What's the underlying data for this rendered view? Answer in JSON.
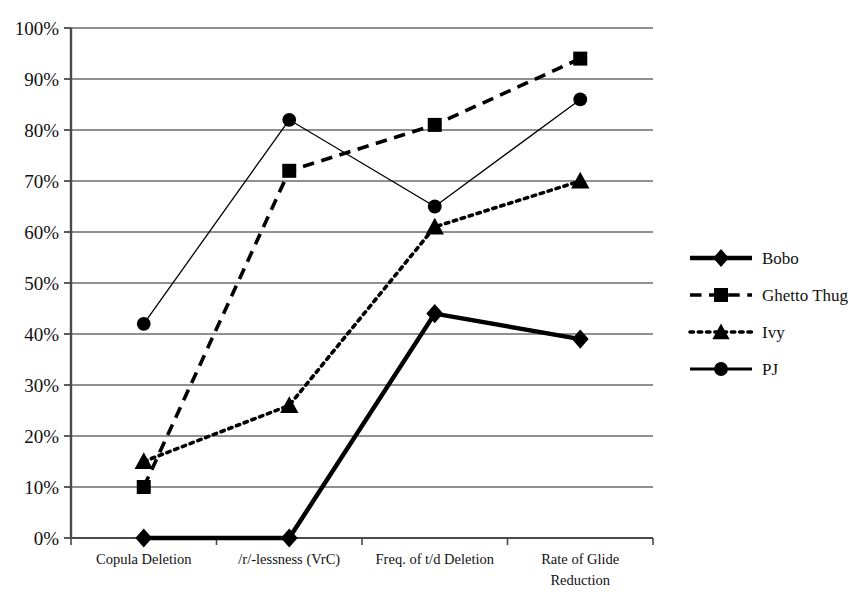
{
  "chart_data": {
    "type": "line",
    "title": "",
    "xlabel": "",
    "ylabel": "",
    "ylim": [
      0,
      100
    ],
    "ytick_labels": [
      "0%",
      "10%",
      "20%",
      "30%",
      "40%",
      "50%",
      "60%",
      "70%",
      "80%",
      "90%",
      "100%"
    ],
    "ytick_values": [
      0,
      10,
      20,
      30,
      40,
      50,
      60,
      70,
      80,
      90,
      100
    ],
    "grid": true,
    "legend_position": "right",
    "categories": [
      "Copula Deletion",
      "/r/-lessness (VrC)",
      "Freq. of t/d Deletion",
      "Rate of Glide Reduction"
    ],
    "series": [
      {
        "name": "Bobo",
        "marker": "diamond",
        "line_style": "solid",
        "line_width": 4.5,
        "color": "#000000",
        "values": [
          0,
          0,
          44,
          39
        ]
      },
      {
        "name": "Ghetto Thug",
        "marker": "square",
        "line_style": "dashed",
        "line_width": 3.6,
        "color": "#000000",
        "values": [
          10,
          72,
          81,
          94
        ]
      },
      {
        "name": "Ivy",
        "marker": "triangle",
        "line_style": "dotted",
        "line_width": 3.6,
        "color": "#000000",
        "values": [
          15,
          26,
          61,
          70
        ]
      },
      {
        "name": "PJ",
        "marker": "circle",
        "line_style": "solid",
        "line_width": 1.3,
        "color": "#000000",
        "values": [
          42,
          82,
          65,
          86
        ]
      }
    ]
  },
  "legend": {
    "items": [
      {
        "label": "Bobo"
      },
      {
        "label": "Ghetto Thug"
      },
      {
        "label": "Ivy"
      },
      {
        "label": "PJ"
      }
    ]
  },
  "colors": {
    "ink": "#000000",
    "gridline": "#6b6b6b",
    "axis": "#4a4a4a",
    "background": "#ffffff"
  }
}
